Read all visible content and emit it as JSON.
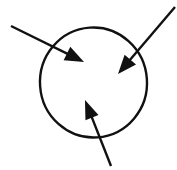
{
  "figure": {
    "background_color": "#ffffff",
    "ink_color": "#111111",
    "width": 177,
    "height": 170
  },
  "shapes": {
    "circle": {
      "name": "central-circle",
      "center_x": 93.5,
      "center_y": 82.5,
      "radius_x": 53.5,
      "radius_y": 55.0,
      "rotation_deg": -4,
      "stroke_width": 2.4,
      "stroke_color": "#111111",
      "fill": "none"
    },
    "arrows": [
      {
        "name": "arrow-top-left",
        "label": "inbound arrow from upper left",
        "direction": "down-right",
        "tail_x": 11,
        "tail_y": 26,
        "tip_x": 84,
        "tip_y": 62,
        "shaft_width": 2.4,
        "head_length": 19,
        "head_width": 15,
        "color": "#111111"
      },
      {
        "name": "arrow-top-right",
        "label": "inbound arrow from upper right",
        "direction": "down-left",
        "tail_x": 175,
        "tail_y": 7,
        "tip_x": 118,
        "tip_y": 74,
        "shaft_width": 2.4,
        "head_length": 19,
        "head_width": 15,
        "color": "#111111"
      },
      {
        "name": "arrow-bottom",
        "label": "inbound arrow from lower right",
        "direction": "up-left",
        "tail_x": 111,
        "tail_y": 166,
        "tip_x": 85,
        "tip_y": 100,
        "shaft_width": 2.4,
        "head_length": 19,
        "head_width": 14,
        "color": "#111111"
      }
    ]
  },
  "annotations": {
    "caption": "",
    "labels": []
  }
}
